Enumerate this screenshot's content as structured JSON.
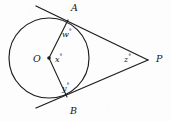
{
  "figure": {
    "background_color": "#fdfdfd",
    "ink_color": "#1c1c1c",
    "points": {
      "center": {
        "label": "O",
        "x": 49,
        "y": 58,
        "label_x": 33,
        "label_y": 54
      },
      "tangent_top": {
        "label": "A",
        "x": 68,
        "y": 20,
        "label_x": 71,
        "label_y": 3
      },
      "tangent_bottom": {
        "label": "B",
        "x": 67,
        "y": 97,
        "label_x": 70,
        "label_y": 106
      },
      "external": {
        "label": "P",
        "x": 148,
        "y": 60,
        "label_x": 156,
        "label_y": 54
      }
    },
    "circle": {
      "cx": 49,
      "cy": 58,
      "r": 40
    },
    "angles": [
      {
        "name": "angle-w",
        "symbol": "w",
        "unit": "°",
        "x": 62,
        "y": 28
      },
      {
        "name": "angle-x",
        "symbol": "x",
        "unit": "°",
        "x": 55,
        "y": 53
      },
      {
        "name": "angle-y",
        "symbol": "y",
        "unit": "°",
        "x": 62,
        "y": 82
      },
      {
        "name": "angle-z",
        "symbol": "z",
        "unit": "°",
        "x": 124,
        "y": 53
      }
    ],
    "segments": {
      "tangent_upper": {
        "from_x": 36,
        "from_y": 6,
        "to_x": 148,
        "to_y": 60
      },
      "tangent_lower": {
        "from_x": 36,
        "from_y": 108,
        "to_x": 148,
        "to_y": 60
      },
      "radius_oa": {
        "from_x": 49,
        "from_y": 58,
        "to_x": 68,
        "to_y": 20
      },
      "radius_ob": {
        "from_x": 49,
        "from_y": 58,
        "to_x": 67,
        "to_y": 97
      }
    }
  }
}
